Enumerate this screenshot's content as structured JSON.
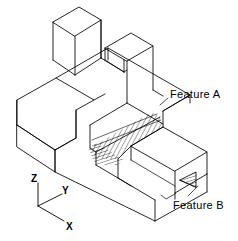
{
  "figure": {
    "type": "isometric-technical-drawing",
    "background_color": "#ffffff",
    "line_color": "#000000"
  },
  "annotations": [
    {
      "id": "feature_a",
      "label": "Feature A",
      "target": "hatched-v-groove"
    },
    {
      "id": "feature_b",
      "label": "Feature B",
      "target": "hatched-notch"
    }
  ],
  "labels": {
    "feature_a": "Feature A",
    "feature_b": "Feature B"
  },
  "axes": {
    "name": "coordinate-triad",
    "origin": {
      "x": 38,
      "y": 206
    },
    "items": [
      {
        "id": "z",
        "label": "Z",
        "direction": "up",
        "end": {
          "x": 38,
          "y": 183
        }
      },
      {
        "id": "y",
        "label": "Y",
        "direction": "upper-right",
        "end": {
          "x": 62,
          "y": 193
        }
      },
      {
        "id": "x",
        "label": "X",
        "direction": "lower-right",
        "end": {
          "x": 64,
          "y": 222
        }
      }
    ]
  },
  "geometry": {
    "base_block": {
      "top_face": "17,100 108,48 190,95 99,147",
      "height_px": 42
    },
    "prong_left": {
      "top_face": "53,22 79,7 101,20 75,36",
      "height_px": 45
    },
    "prong_right": {
      "top_face": "105,48 131,33 153,46 127,61",
      "height_px": 46
    },
    "groove": {
      "style": "section-hatch",
      "angle_deg": 28,
      "spacing_px": 3
    },
    "notch": {
      "style": "section-hatch",
      "angle_deg": 70,
      "spacing_px": 3
    }
  }
}
